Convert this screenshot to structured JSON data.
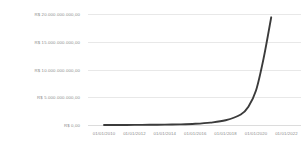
{
  "chart_data": {
    "type": "line",
    "title": "",
    "subtitle": "",
    "xlabel": "",
    "ylabel": "",
    "grid": true,
    "legend": null,
    "legend_position": "none",
    "currency_prefix": "R$",
    "locale_number_format": "pt-BR",
    "series_color": "#3b3b3b",
    "gridline_color": "#e8e8e8",
    "tick_label_color": "#8a8a8a",
    "background_color": "#ffffff",
    "ylim": [
      0,
      20000000000
    ],
    "ytick_values": [
      20000000000,
      15000000000,
      10000000000,
      5000000000,
      0
    ],
    "ytick_labels": [
      "R$ 20.000.000.000,00",
      "R$ 15.000.000.000,00",
      "R$ 10.000.000.000,00",
      "R$ 5.000.000.000,00",
      "R$ 0,00"
    ],
    "xtick_labels": [
      "01/01/2010",
      "01/01/2012",
      "01/01/2014",
      "01/01/2016",
      "01/01/2018",
      "01/01/2020",
      "01/01/2022"
    ],
    "xlim": [
      "01/01/2009",
      "01/01/2023"
    ],
    "series": [
      {
        "name": "",
        "x": [
          "01/01/2010",
          "01/01/2011",
          "01/01/2012",
          "01/01/2013",
          "01/01/2014",
          "01/01/2015",
          "01/01/2016",
          "01/01/2017",
          "01/01/2018",
          "01/01/2019",
          "01/01/2019-06",
          "01/01/2020",
          "01/01/2020-06",
          "01/01/2021"
        ],
        "values": [
          5000000,
          9000000,
          17000000,
          32000000,
          60000000,
          115000000,
          220000000,
          430000000,
          850000000,
          1900000000,
          3300000000,
          6200000000,
          12000000000,
          19400000000
        ]
      }
    ]
  }
}
